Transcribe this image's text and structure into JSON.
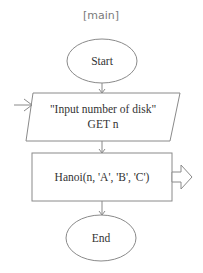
{
  "diagram": {
    "title": "[main]",
    "nodes": [
      {
        "id": "start",
        "type": "terminator",
        "label": "Start"
      },
      {
        "id": "input",
        "type": "io",
        "lines": [
          "\"Input number of disk\"",
          "GET n"
        ]
      },
      {
        "id": "call",
        "type": "process",
        "label": "Hanoi(n,  'A',  'B',  'C')"
      },
      {
        "id": "end",
        "type": "terminator",
        "label": "End"
      }
    ],
    "edges": [
      {
        "from": "start",
        "to": "input"
      },
      {
        "from": "input",
        "to": "call"
      },
      {
        "from": "call",
        "to": "end"
      }
    ],
    "annotations": {
      "input_entry_arrow": "open-arrow-left",
      "call_exit_arrow": "hollow-block-arrow-right"
    },
    "colors": {
      "stroke": "#8a8a8a",
      "text": "#333333",
      "title": "#7a7a7a",
      "background": "#ffffff"
    }
  }
}
